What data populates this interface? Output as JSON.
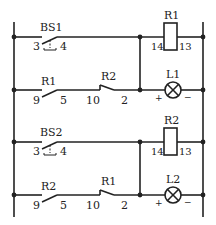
{
  "diagram": {
    "type": "ladder-circuit",
    "colors": {
      "line": "#222222",
      "background": "#ffffff"
    },
    "rung1": {
      "switch": {
        "name": "BS1",
        "terminal_left": "3",
        "terminal_right": "4",
        "type": "pushbutton-NO"
      },
      "coil": {
        "name": "R1",
        "terminal_left": "14",
        "terminal_right": "13"
      }
    },
    "rung2": {
      "contact_no": {
        "name": "R1",
        "terminal_left": "9",
        "terminal_right": "5"
      },
      "contact_nc": {
        "name": "R2",
        "terminal_left": "10",
        "terminal_right": "2"
      },
      "lamp": {
        "name": "L1",
        "plus": "+",
        "minus": "−"
      }
    },
    "rung3": {
      "switch": {
        "name": "BS2",
        "terminal_left": "3",
        "terminal_right": "4",
        "type": "pushbutton-NO"
      },
      "coil": {
        "name": "R2",
        "terminal_left": "14",
        "terminal_right": "13"
      }
    },
    "rung4": {
      "contact_no": {
        "name": "R2",
        "terminal_left": "9",
        "terminal_right": "5"
      },
      "contact_nc": {
        "name": "R1",
        "terminal_left": "10",
        "terminal_right": "2"
      },
      "lamp": {
        "name": "L2",
        "plus": "+",
        "minus": "−"
      }
    }
  }
}
